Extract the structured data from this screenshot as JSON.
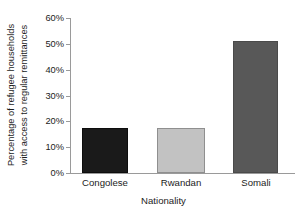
{
  "chart_data": {
    "type": "bar",
    "title": "",
    "subtitle": "",
    "categories": [
      "Congolese",
      "Rwandan",
      "Somali"
    ],
    "values": [
      17.5,
      17.3,
      51
    ],
    "value_labels": [
      "17.5%",
      "17.3%",
      "51%"
    ],
    "series": [
      {
        "name": "Percentage of refugee households with access to regular remittances",
        "values": [
          17.5,
          17.3,
          51
        ]
      }
    ],
    "xlabel": "Nationality",
    "ylabel_lines": [
      "Percentage of refugee households",
      "with access to regular remittances"
    ],
    "ylabel": "Percentage of refugee households with access to regular remittances",
    "ylim": [
      0,
      60
    ],
    "ytick_values": [
      0,
      10,
      20,
      30,
      40,
      50,
      60
    ],
    "ytick_labels": [
      "0%",
      "10%",
      "20%",
      "30%",
      "40%",
      "50%",
      "60%"
    ],
    "grid": false,
    "legend": false,
    "legend_position": "none",
    "bar_colors": [
      "#1a1a1a",
      "#c2c2c2",
      "#585858"
    ],
    "bar_edge_colors": [
      "#0d0d0d",
      "#8f8f8f",
      "#4a4a4a"
    ],
    "axis_color": "#9a9a9a",
    "text_color": "#1c1c1c",
    "background_color": "#ffffff"
  }
}
